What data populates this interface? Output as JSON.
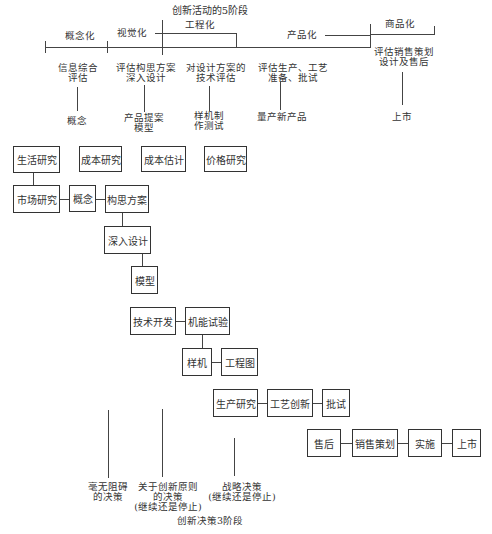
{
  "timeline": {
    "title": "创新活动的5阶段",
    "phases": [
      {
        "label": "概念化"
      },
      {
        "label": "视觉化"
      },
      {
        "label": "工程化"
      },
      {
        "label": "产品化"
      },
      {
        "label": "商品化"
      }
    ],
    "activities": [
      {
        "top": "信息综合\n评估",
        "bottom": "概念"
      },
      {
        "top": "评估构思方案\n深入设计",
        "bottom": "产品提案\n模型"
      },
      {
        "top": "对设计方案的\n技术评估",
        "bottom": "样机制\n作测试"
      },
      {
        "top": "评估生产、工艺\n准备、批试",
        "bottom": "量产新产品"
      },
      {
        "top": "评估销售策划\n设计及售后",
        "bottom": "上市"
      }
    ]
  },
  "boxes": {
    "life_research": "生活研究",
    "cost_research": "成本研究",
    "cost_estimate": "成本估计",
    "price_research": "价格研究",
    "market_research": "市场研究",
    "concept": "概念",
    "concept_plan": "构思方案",
    "deep_design": "深入设计",
    "model": "模型",
    "tech_dev": "技术开发",
    "function_test": "机能试验",
    "prototype": "样机",
    "engineering_drawing": "工程图",
    "production_research": "生产研究",
    "process_innovation": "工艺创新",
    "trial_production": "批试",
    "after_sales": "售后",
    "sales_planning": "销售策划",
    "implementation": "实施",
    "launch": "上市"
  },
  "decisions": {
    "title": "创新决策3阶段",
    "items": [
      {
        "label": "毫无阻碍\n的决策"
      },
      {
        "label": "关于创新原则\n的决策\n(继续还是停止)"
      },
      {
        "label": "战略决策\n(继续还是停止)"
      }
    ]
  }
}
